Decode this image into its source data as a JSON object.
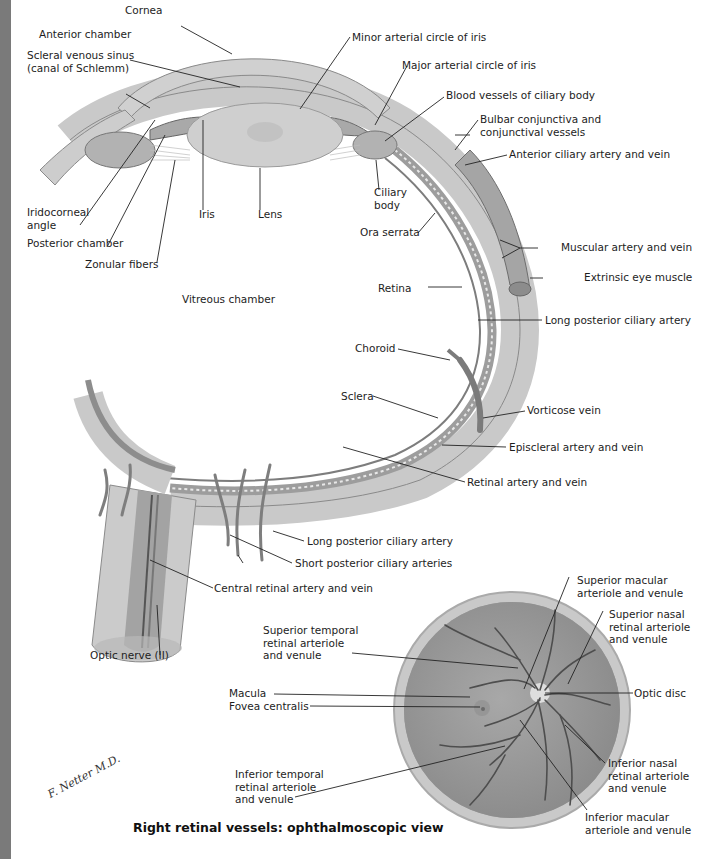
{
  "sidebar": {
    "text": ""
  },
  "cross_section": {
    "labels": {
      "cornea": "Cornea",
      "anterior_chamber": "Anterior chamber",
      "scleral_venous_sinus": "Scleral venous sinus\n(canal of Schlemm)",
      "minor_arterial_circle": "Minor arterial circle of iris",
      "major_arterial_circle": "Major arterial circle of iris",
      "ciliary_vessels": "Blood vessels of ciliary body",
      "bulbar_conjunctiva": "Bulbar conjunctiva and\nconjunctival vessels",
      "anterior_ciliary": "Anterior ciliary artery and vein",
      "iridocorneal_angle": "Iridocorneal\nangle",
      "posterior_chamber": "Posterior chamber",
      "zonular_fibers": "Zonular fibers",
      "iris": "Iris",
      "lens": "Lens",
      "ciliary_body": "Ciliary\nbody",
      "ora_serrata": "Ora serrata",
      "muscular_artery": "Muscular artery and vein",
      "extrinsic_muscle": "Extrinsic eye muscle",
      "vitreous_chamber": "Vitreous chamber",
      "retina": "Retina",
      "long_posterior_ciliary_1": "Long posterior ciliary artery",
      "choroid": "Choroid",
      "sclera": "Sclera",
      "vorticose_vein": "Vorticose vein",
      "episcleral": "Episcleral artery and vein",
      "retinal_artery": "Retinal artery and vein",
      "long_posterior_ciliary_2": "Long posterior ciliary artery",
      "short_posterior_ciliary": "Short posterior ciliary arteries",
      "central_retinal": "Central retinal artery and vein",
      "optic_nerve": "Optic nerve (II)"
    }
  },
  "fundus_view": {
    "labels": {
      "superior_macular": "Superior macular\narteriole and venule",
      "superior_nasal": "Superior nasal\nretinal arteriole\nand venule",
      "superior_temporal": "Superior temporal\nretinal arteriole\nand venule",
      "macula": "Macula",
      "fovea": "Fovea centralis",
      "optic_disc": "Optic disc",
      "inferior_temporal": "Inferior temporal\nretinal arteriole\nand venule",
      "inferior_nasal": "Inferior nasal\nretinal arteriole\nand venule",
      "inferior_macular": "Inferior macular\narteriole and venule"
    },
    "caption": "Right retinal vessels: ophthalmoscopic view"
  },
  "signature": "F. Netter M.D."
}
